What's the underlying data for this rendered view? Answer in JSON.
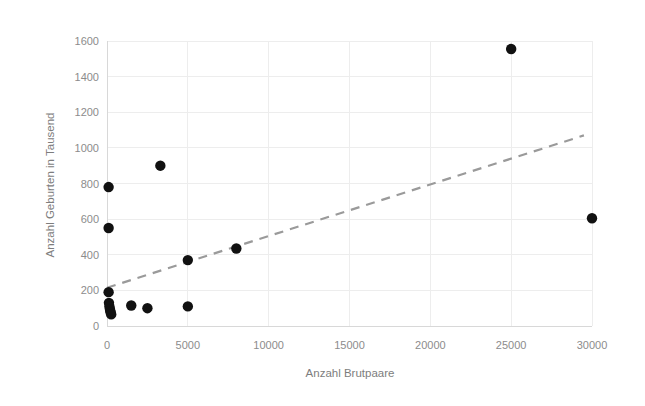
{
  "chart_data": {
    "type": "scatter",
    "title": "",
    "xlabel": "Anzahl Brutpaare",
    "ylabel": "Anzahl Geburten in Tausend",
    "xlim": [
      0,
      30000
    ],
    "ylim": [
      0,
      1600
    ],
    "xticks": [
      0,
      5000,
      10000,
      15000,
      20000,
      25000,
      30000
    ],
    "yticks": [
      0,
      200,
      400,
      600,
      800,
      1000,
      1200,
      1400,
      1600
    ],
    "xtick_labels": [
      "0",
      "5000",
      "10000",
      "15000",
      "20000",
      "25000",
      "30000"
    ],
    "ytick_labels": [
      "0",
      "200",
      "400",
      "600",
      "800",
      "1000",
      "1200",
      "1400",
      "1600"
    ],
    "grid": true,
    "legend": false,
    "marker_color": "#111111",
    "points": [
      {
        "x": 100,
        "y": 780
      },
      {
        "x": 100,
        "y": 550
      },
      {
        "x": 100,
        "y": 190
      },
      {
        "x": 120,
        "y": 130
      },
      {
        "x": 150,
        "y": 110
      },
      {
        "x": 180,
        "y": 95
      },
      {
        "x": 200,
        "y": 85
      },
      {
        "x": 230,
        "y": 75
      },
      {
        "x": 260,
        "y": 65
      },
      {
        "x": 1500,
        "y": 115
      },
      {
        "x": 2500,
        "y": 100
      },
      {
        "x": 3300,
        "y": 900
      },
      {
        "x": 5000,
        "y": 110
      },
      {
        "x": 5000,
        "y": 370
      },
      {
        "x": 8000,
        "y": 435
      },
      {
        "x": 25000,
        "y": 1555
      },
      {
        "x": 30000,
        "y": 605
      }
    ],
    "trendline": {
      "style": "dashed",
      "color": "#9a9a9a",
      "x_start": 0,
      "y_start": 215,
      "x_end": 29500,
      "y_end": 1070
    }
  }
}
